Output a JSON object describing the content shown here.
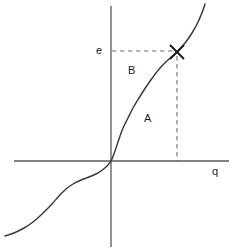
{
  "figure": {
    "title": "",
    "background_color": "#ffffff",
    "stroke_color": "#3a3a3a",
    "axis_color": "#5a5a5a",
    "dash_color": "#6e6e6e",
    "text_color": "#1c1c1c"
  },
  "axes": {
    "x_axis": {
      "label": "q",
      "origin_px": {
        "x": 111,
        "y": 161
      },
      "start_px": {
        "x": 14,
        "y": 161
      },
      "end_px": {
        "x": 229,
        "y": 161
      },
      "label_pos_px": {
        "x": 212,
        "y": 166
      }
    },
    "y_axis": {
      "label": "e",
      "start_px": {
        "x": 111,
        "y": 6
      },
      "end_px": {
        "x": 111,
        "y": 247
      },
      "label_pos_px": {
        "x": 96,
        "y": 45
      }
    }
  },
  "marker": {
    "name": "equilibrium-point",
    "glyph": "X",
    "pos_px": {
      "x": 177,
      "y": 52
    }
  },
  "guides": [
    {
      "name": "horizontal-guide",
      "orientation": "horizontal",
      "from_px": {
        "x": 112,
        "y": 51
      },
      "to_px": {
        "x": 177,
        "y": 51
      },
      "style": "dashed"
    },
    {
      "name": "vertical-guide",
      "orientation": "vertical",
      "from_px": {
        "x": 177,
        "y": 56
      },
      "to_px": {
        "x": 177,
        "y": 161
      },
      "style": "dashed"
    }
  ],
  "regions": [
    {
      "name": "region-A",
      "label": "A",
      "pos_px": {
        "x": 144,
        "y": 113
      }
    },
    {
      "name": "region-B",
      "label": "B",
      "pos_px": {
        "x": 128,
        "y": 65
      }
    }
  ],
  "chart_data": {
    "type": "line",
    "title": "",
    "xlabel": "q",
    "ylabel": "e",
    "grid": false,
    "legend": null,
    "annotations": [
      {
        "text": "A",
        "x_px": 144,
        "y_px": 113
      },
      {
        "text": "B",
        "x_px": 128,
        "y_px": 65
      },
      {
        "text": "X",
        "x_px": 177,
        "y_px": 52
      }
    ],
    "series": [
      {
        "name": "supply-curve",
        "description": "Monotonic S-shaped (cubic-like) curve passing through the origin, flattening at lower-left and steepening to the upper-right.",
        "points_px": [
          [
            5,
            236
          ],
          [
            14,
            233
          ],
          [
            24,
            228
          ],
          [
            33,
            222
          ],
          [
            42,
            214
          ],
          [
            51,
            205
          ],
          [
            59,
            196
          ],
          [
            66,
            189
          ],
          [
            73,
            184
          ],
          [
            81,
            180
          ],
          [
            89,
            177
          ],
          [
            96,
            174
          ],
          [
            101,
            171
          ],
          [
            106,
            167
          ],
          [
            111,
            161
          ],
          [
            115,
            151
          ],
          [
            119,
            139
          ],
          [
            123,
            128
          ],
          [
            128,
            118
          ],
          [
            133,
            108
          ],
          [
            139,
            98
          ],
          [
            146,
            87
          ],
          [
            153,
            77
          ],
          [
            160,
            68
          ],
          [
            168,
            60
          ],
          [
            177,
            52
          ],
          [
            185,
            43
          ],
          [
            192,
            33
          ],
          [
            198,
            22
          ],
          [
            203,
            10
          ],
          [
            205,
            4
          ]
        ]
      }
    ]
  }
}
